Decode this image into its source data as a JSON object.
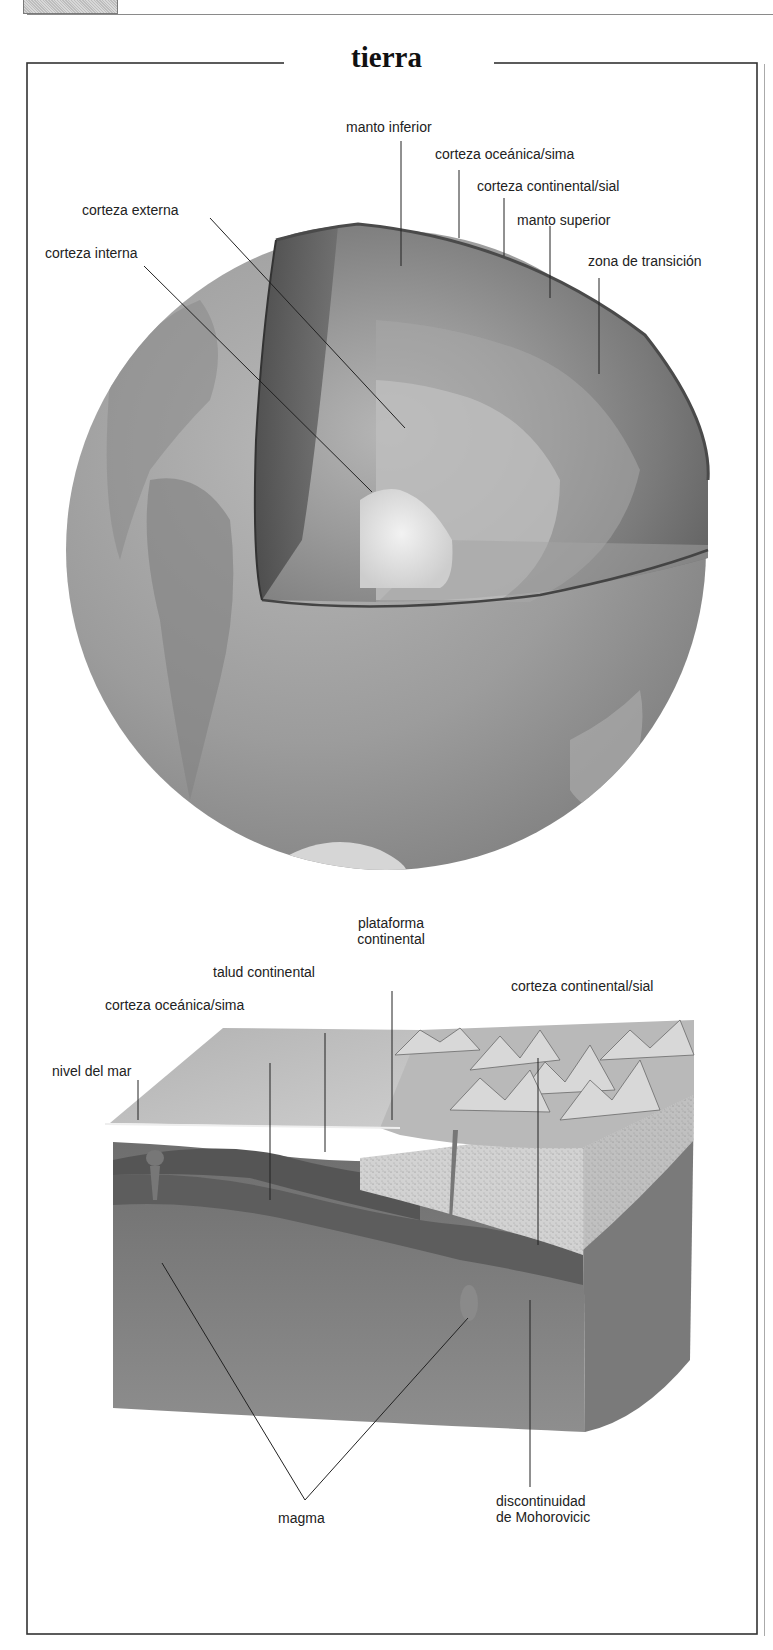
{
  "page": {
    "title": "tierra"
  },
  "globe": {
    "labels": {
      "manto_inferior": "manto inferior",
      "corteza_oceanica_sima": "corteza oceánica/sima",
      "corteza_continental_sial": "corteza continental/sial",
      "corteza_externa": "corteza externa",
      "manto_superior": "manto superior",
      "corteza_interna": "corteza interna",
      "zona_de_transicion": "zona de transición"
    }
  },
  "block": {
    "labels": {
      "plataforma_line1": "plataforma",
      "plataforma_line2": "continental",
      "talud_continental": "talud continental",
      "corteza_continental_sial": "corteza continental/sial",
      "corteza_oceanica_sima": "corteza oceánica/sima",
      "nivel_del_mar": "nivel del mar",
      "magma": "magma",
      "mohorovicic_line1": "discontinuidad",
      "mohorovicic_line2": "de Mohorovicic"
    }
  },
  "colors": {
    "frame": "#333333",
    "globe_surface": "#9a9a9a",
    "mantle_dark": "#5e5e5e",
    "core_light": "#e6e6e6"
  }
}
